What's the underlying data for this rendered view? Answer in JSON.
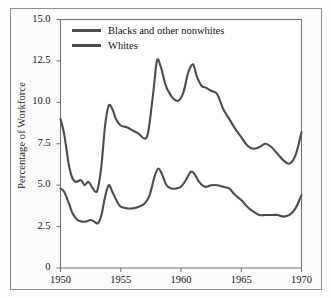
{
  "chart_data": {
    "type": "line",
    "title": "",
    "xlabel": "",
    "ylabel": "Percentage of Workforce",
    "xlim": [
      1950,
      1970
    ],
    "ylim": [
      0,
      15
    ],
    "grid": false,
    "legend_position": "top-left-inside",
    "x_ticks": [
      "1950",
      "1955",
      "1960",
      "1965",
      "1970"
    ],
    "y_ticks": [
      "0",
      "2.5",
      "5.0",
      "7.5",
      "10.0",
      "12.5",
      "15.0"
    ],
    "line_color": "#4c4c4c",
    "series": [
      {
        "name": "Blacks and other nonwhites",
        "x": [
          1950.0,
          1950.3,
          1950.7,
          1951.0,
          1951.3,
          1951.7,
          1952.0,
          1952.3,
          1952.6,
          1952.9,
          1953.1,
          1953.4,
          1953.7,
          1954.0,
          1954.3,
          1954.6,
          1955.0,
          1955.5,
          1956.0,
          1956.5,
          1957.0,
          1957.3,
          1957.7,
          1958.0,
          1958.3,
          1958.7,
          1959.0,
          1959.4,
          1959.8,
          1960.2,
          1960.6,
          1961.0,
          1961.3,
          1961.7,
          1962.0,
          1962.5,
          1963.0,
          1963.5,
          1964.0,
          1964.5,
          1965.0,
          1965.5,
          1966.0,
          1966.5,
          1967.0,
          1967.5,
          1968.0,
          1968.5,
          1969.0,
          1969.5,
          1970.0
        ],
        "y": [
          9.0,
          8.1,
          6.2,
          5.4,
          5.2,
          5.3,
          5.0,
          5.2,
          4.9,
          4.6,
          4.8,
          6.2,
          8.6,
          9.8,
          9.6,
          9.0,
          8.6,
          8.5,
          8.3,
          8.1,
          7.8,
          8.3,
          10.6,
          12.5,
          12.2,
          11.1,
          10.6,
          10.2,
          10.1,
          10.6,
          11.8,
          12.3,
          11.6,
          11.0,
          10.9,
          10.7,
          10.5,
          9.6,
          9.0,
          8.4,
          7.9,
          7.4,
          7.2,
          7.3,
          7.5,
          7.3,
          6.9,
          6.5,
          6.3,
          6.8,
          8.2
        ]
      },
      {
        "name": "Whites",
        "x": [
          1950.0,
          1950.3,
          1950.7,
          1951.0,
          1951.4,
          1951.8,
          1952.1,
          1952.5,
          1952.8,
          1953.1,
          1953.4,
          1953.7,
          1954.0,
          1954.3,
          1954.7,
          1955.0,
          1955.5,
          1956.0,
          1956.5,
          1957.0,
          1957.4,
          1957.8,
          1958.1,
          1958.4,
          1958.8,
          1959.2,
          1959.6,
          1960.0,
          1960.4,
          1960.8,
          1961.1,
          1961.5,
          1962.0,
          1962.5,
          1963.0,
          1963.5,
          1964.0,
          1964.5,
          1965.0,
          1965.5,
          1966.0,
          1966.5,
          1967.0,
          1967.5,
          1968.0,
          1968.5,
          1969.0,
          1969.5,
          1970.0
        ],
        "y": [
          4.8,
          4.6,
          3.9,
          3.3,
          2.9,
          2.8,
          2.8,
          2.9,
          2.8,
          2.7,
          3.2,
          4.3,
          5.0,
          4.6,
          4.0,
          3.7,
          3.6,
          3.6,
          3.7,
          3.9,
          4.4,
          5.5,
          6.0,
          5.7,
          5.0,
          4.8,
          4.8,
          4.9,
          5.3,
          5.8,
          5.7,
          5.2,
          4.9,
          5.0,
          5.0,
          4.9,
          4.8,
          4.4,
          4.1,
          3.7,
          3.4,
          3.2,
          3.2,
          3.2,
          3.2,
          3.1,
          3.2,
          3.6,
          4.4
        ]
      }
    ]
  },
  "legend": {
    "items": [
      {
        "label": "Blacks and other nonwhites"
      },
      {
        "label": "Whites"
      }
    ]
  },
  "axes": {
    "y_title": "Percentage of Workforce"
  }
}
